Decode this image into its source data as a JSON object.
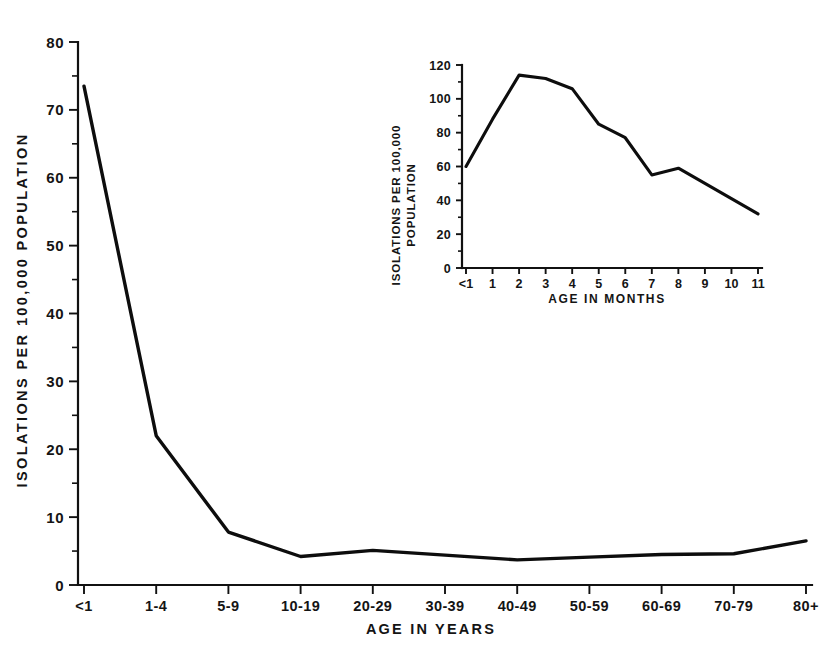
{
  "figure": {
    "background_color": "#ffffff",
    "ink_color": "#0d0d0d",
    "caption_fragment": ""
  },
  "chart_data": [
    {
      "id": "main",
      "type": "line",
      "title": "",
      "xlabel": "AGE IN YEARS",
      "ylabel": "ISOLATIONS PER 100,000 POPULATION",
      "categories": [
        "<1",
        "1-4",
        "5-9",
        "10-19",
        "20-29",
        "30-39",
        "40-49",
        "50-59",
        "60-69",
        "70-79",
        "80+"
      ],
      "values": [
        73.5,
        22.0,
        7.8,
        4.2,
        5.1,
        4.4,
        3.7,
        4.1,
        4.5,
        4.6,
        6.5
      ],
      "ylim": [
        0,
        80
      ],
      "yticks": [
        0,
        10,
        20,
        30,
        40,
        50,
        60,
        70,
        80
      ],
      "ytick_labels": [
        "0",
        "10",
        "20",
        "30",
        "40",
        "50",
        "60",
        "70",
        "80"
      ],
      "yminor_step": 5,
      "grid": false,
      "legend": "none"
    },
    {
      "id": "inset",
      "type": "line",
      "title": "",
      "xlabel": "AGE IN MONTHS",
      "ylabel_line1": "ISOLATIONS PER 100,000",
      "ylabel_line2": "POPULATION",
      "categories": [
        "<1",
        "1",
        "2",
        "3",
        "4",
        "5",
        "6",
        "7",
        "8",
        "9",
        "10",
        "11"
      ],
      "values": [
        60,
        88,
        114,
        112,
        106,
        85,
        77,
        55,
        59,
        50,
        41,
        32
      ],
      "ylim": [
        0,
        120
      ],
      "yticks": [
        0,
        20,
        40,
        60,
        80,
        100,
        120
      ],
      "ytick_labels": [
        "0",
        "20",
        "40",
        "60",
        "80",
        "100",
        "120"
      ],
      "yminor_step": 10,
      "grid": false,
      "legend": "none"
    }
  ]
}
